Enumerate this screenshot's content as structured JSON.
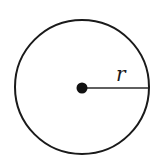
{
  "diagram": {
    "type": "circle-with-radius",
    "circle": {
      "cx": 82,
      "cy": 87,
      "r": 67,
      "stroke": "#1a1a1a",
      "stroke_width": 2
    },
    "center_point": {
      "cx": 82,
      "cy": 88,
      "r": 5.5,
      "fill": "#111111"
    },
    "radius_line": {
      "x1": 82,
      "y1": 88,
      "x2": 148,
      "y2": 88,
      "stroke": "#2a2a2a",
      "stroke_width": 1.6
    },
    "radius_label": {
      "text": "r",
      "x": 116,
      "y": 81
    }
  }
}
